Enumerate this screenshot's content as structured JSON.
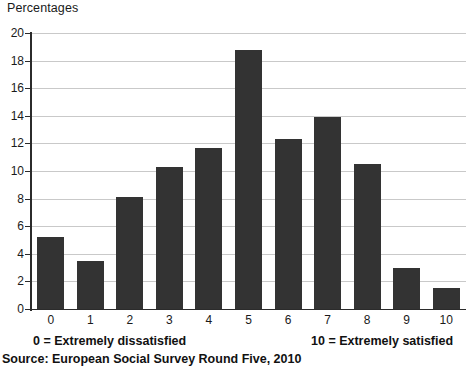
{
  "chart_data": {
    "type": "bar",
    "title": "Percentages",
    "xlabel": "",
    "ylabel": "Percentages",
    "categories": [
      "0",
      "1",
      "2",
      "3",
      "4",
      "5",
      "6",
      "7",
      "8",
      "9",
      "10"
    ],
    "values": [
      5.2,
      3.5,
      8.1,
      10.3,
      11.7,
      18.8,
      12.3,
      13.9,
      10.5,
      3.0,
      1.5
    ],
    "ylim": [
      0,
      20
    ],
    "ytick_labels": [
      "0",
      "2",
      "4",
      "6",
      "8",
      "10",
      "12",
      "14",
      "16",
      "18",
      "20"
    ],
    "ytick_values": [
      0,
      2,
      4,
      6,
      8,
      10,
      12,
      14,
      16,
      18,
      20
    ],
    "grid": true,
    "legend": false,
    "bar_color": "#333333",
    "gridline_color": "#c9c9c9",
    "axis_color": "#2b2b2b",
    "annotations": [
      "0 = Extremely dissatisfied",
      "10 = Extremely satisfied"
    ]
  },
  "captions": {
    "left": "0 = Extremely dissatisfied",
    "right": "10 = Extremely satisfied"
  },
  "source": {
    "text": "Source: European Social Survey Round Five, 2010"
  }
}
